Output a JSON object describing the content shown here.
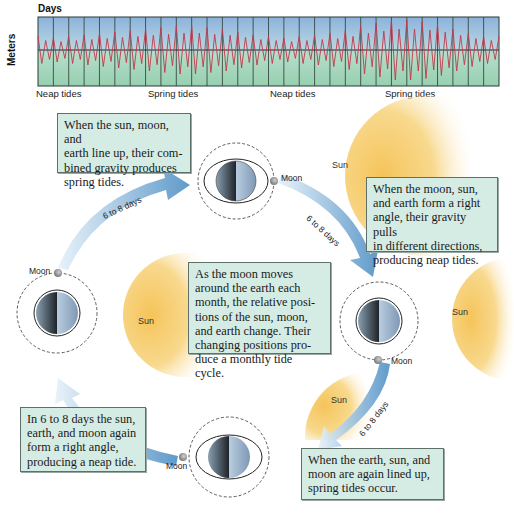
{
  "chart": {
    "title": "Days",
    "ylabel": "Meters",
    "phase_labels": [
      {
        "text": "Neap tides",
        "x": 36
      },
      {
        "text": "Spring tides",
        "x": 148
      },
      {
        "text": "Neap tides",
        "x": 270
      },
      {
        "text": "Spring tides",
        "x": 385
      }
    ],
    "colors": {
      "sky_top": "#8fb3d9",
      "sea_bottom": "#9fd4b8",
      "tide_line": "#c0394a",
      "grid": "#2b3a35"
    }
  },
  "chart_data": {
    "type": "line",
    "title": "Days",
    "xlabel": "Days",
    "ylabel": "Meters",
    "x_divisions": 30,
    "annotations": [
      "Neap tides",
      "Spring tides",
      "Neap tides",
      "Spring tides"
    ],
    "series": [
      {
        "name": "Tide height (relative amplitude per day)",
        "values": [
          0.45,
          0.4,
          0.45,
          0.5,
          0.55,
          0.6,
          0.65,
          0.7,
          0.75,
          0.8,
          0.8,
          0.75,
          0.7,
          0.6,
          0.5,
          0.45,
          0.4,
          0.45,
          0.5,
          0.55,
          0.65,
          0.8,
          0.9,
          1.0,
          1.0,
          0.95,
          0.85,
          0.7,
          0.55,
          0.45
        ]
      }
    ],
    "grid": true
  },
  "boxes": {
    "spring_lineup": "When the sun, moon, and earth line up, their combined gravity produces spring tides.",
    "neap_right_angle": "When the moon, sun, and earth form a right angle, their gravity pulls in different directions, producing neap tides.",
    "monthly_cycle": "As the moon moves around the earth each month, the relative positions of the sun, moon, and earth change. Their changing positions produce a monthly tide cycle.",
    "neap_again": "In 6 to 8 days the sun, earth, and moon again form a right angle, producing a neap tide.",
    "spring_again": "When the earth, sun, and moon are again lined up, spring tides occur."
  },
  "box_lines": {
    "spring_lineup": [
      "When the sun, moon, and",
      "earth line up, their com-",
      "bined gravity produces",
      "spring tides."
    ],
    "neap_right_angle": [
      "When the moon, sun,",
      "and earth form a right",
      "angle, their gravity pulls",
      "in different directions,",
      "producing neap tides."
    ],
    "monthly_cycle": [
      "As the moon moves",
      "around the earth each",
      "month, the relative posi-",
      "tions of the sun, moon,",
      "and earth change. Their",
      "changing positions pro-",
      "duce a monthly tide cycle."
    ],
    "neap_again": [
      "In 6 to 8 days the sun,",
      "earth, and moon again",
      "form a right angle,",
      "producing a neap tide."
    ],
    "spring_again": [
      "When the earth, sun, and",
      "moon are again lined up,",
      "spring tides occur."
    ]
  },
  "labels": {
    "moon": "Moon",
    "sun": "Sun",
    "interval": "6 to 8 days"
  }
}
